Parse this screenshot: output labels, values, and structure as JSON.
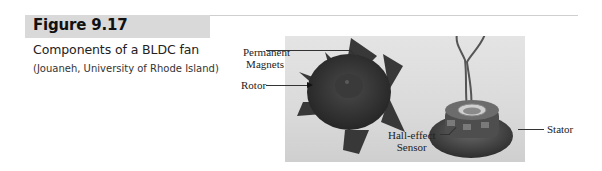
{
  "figure": {
    "number_label": "Figure 9.17",
    "caption": "Components of a BLDC fan",
    "credit": "(Jouaneh, University of Rhode Island)"
  },
  "photo": {
    "description": "Photograph of disassembled brushless DC fan: rotor with blades (left) and stator with Hall-effect sensor and wires (right)",
    "labels": {
      "permanent_magnets_line1": "Permanent",
      "permanent_magnets_line2": "Magnets",
      "rotor": "Rotor",
      "hall_effect_line1": "Hall-effect",
      "hall_effect_line2": "Sensor",
      "stator": "Stator"
    }
  },
  "colors": {
    "header_bar": "#d9d9d9",
    "rule": "#cfcfcf",
    "text": "#222222"
  }
}
